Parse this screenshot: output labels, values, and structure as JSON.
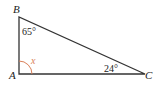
{
  "diagram": {
    "type": "right-triangle",
    "vertices": {
      "A": {
        "label": "A"
      },
      "B": {
        "label": "B"
      },
      "C": {
        "label": "C"
      }
    },
    "angles": {
      "B": "65°",
      "C": "24°",
      "A": "x"
    },
    "colors": {
      "lines": "#333333",
      "unknown_angle": "#d9805a"
    }
  }
}
